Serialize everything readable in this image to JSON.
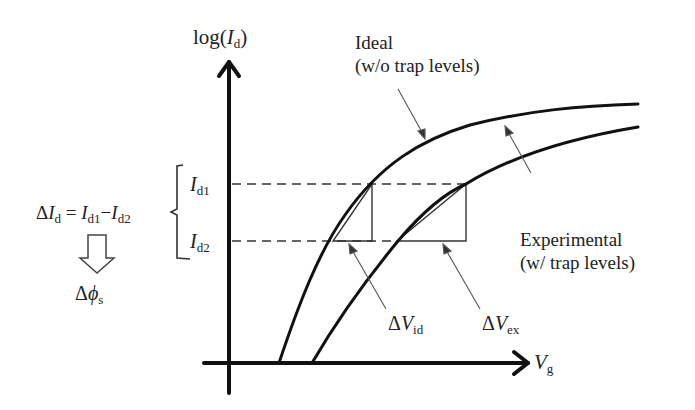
{
  "diagram": {
    "axes": {
      "y_label": {
        "prefix": "log(",
        "var": "I",
        "sub": "d",
        "suffix": ")"
      },
      "x_label": {
        "var": "V",
        "sub": "g"
      }
    },
    "curves": [
      {
        "name": "Ideal",
        "label_line1": "Ideal",
        "label_line2": "(w/o trap levels)"
      },
      {
        "name": "Experimental",
        "label_line1": "Experimental",
        "label_line2": "(w/ trap levels)"
      }
    ],
    "levels": {
      "upper": {
        "var": "I",
        "sub": "d1"
      },
      "lower": {
        "var": "I",
        "sub": "d2"
      }
    },
    "equation": {
      "delta": "Δ",
      "lhs_var": "I",
      "lhs_sub": "d",
      "eq": " = ",
      "t1_var": "I",
      "t1_sub": "d1",
      "minus": "−",
      "t2_var": "I",
      "t2_sub": "d2"
    },
    "result": {
      "delta": "Δ",
      "var": "ϕ",
      "sub": "s"
    },
    "deltas": [
      {
        "delta": "Δ",
        "var": "V",
        "sub": "id"
      },
      {
        "delta": "Δ",
        "var": "V",
        "sub": "ex"
      }
    ],
    "colors": {
      "line": "#111111",
      "thin": "#555555",
      "text": "#222222",
      "background": "#ffffff"
    }
  }
}
